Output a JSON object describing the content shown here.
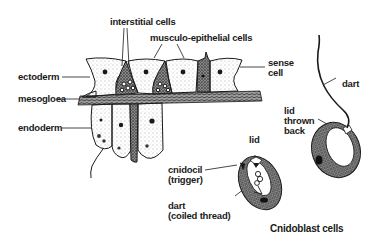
{
  "diagram": {
    "title": "Cnidoblast cells",
    "tissue_labels": {
      "interstitial": "interstitial cells",
      "musculo": "musculo-epithelial cells",
      "ectoderm": "ectoderm",
      "mesogloea": "mesogloea",
      "endoderm": "endoderm",
      "sense_line1": "sense",
      "sense_line2": "cell"
    },
    "cnidoblast_loaded": {
      "lid": "lid",
      "cnidocil_line1": "cnidocil",
      "cnidocil_line2": "(trigger)",
      "dart_line1": "dart",
      "dart_line2": "(coiled thread)"
    },
    "cnidoblast_discharged": {
      "dart": "dart",
      "lid_line1": "lid",
      "lid_line2": "thrown",
      "lid_line3": "back"
    },
    "colors": {
      "ink": "#1a1a1a",
      "stipple": "#555555",
      "background": "#ffffff"
    }
  }
}
